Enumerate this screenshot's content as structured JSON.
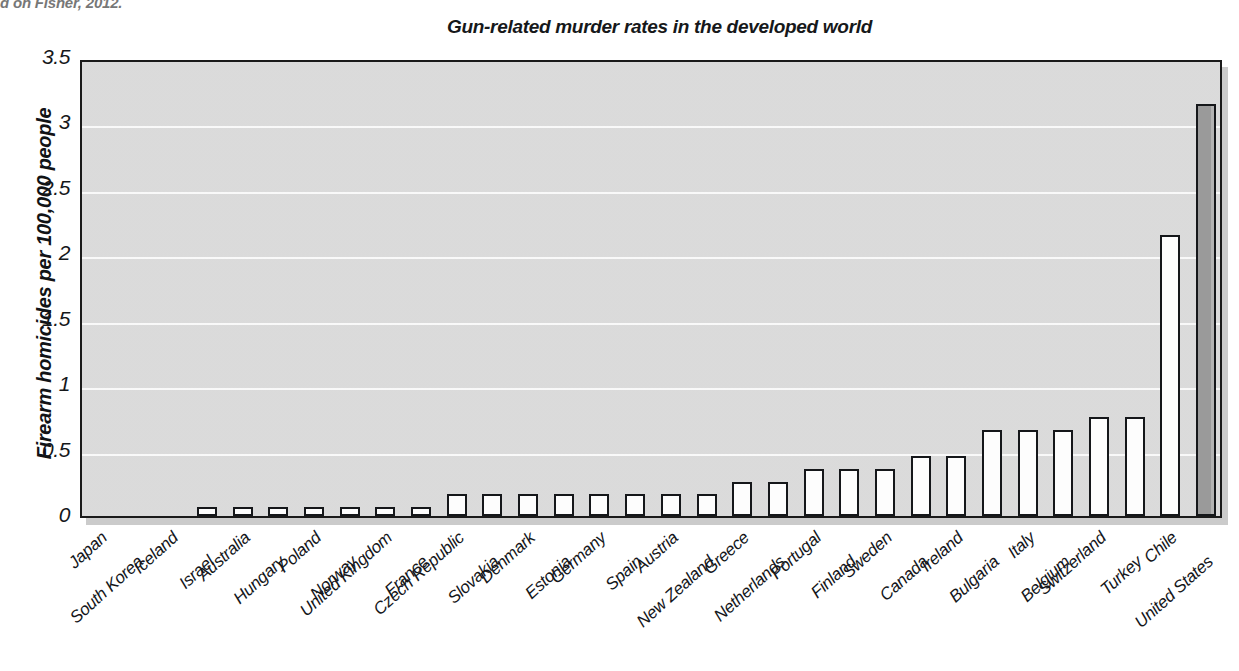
{
  "caption_fragment": "d on Fisher, 2012.",
  "chart_title": "Gun-related murder rates in the developed world",
  "axes": {
    "y_title": "Firearm homicides per 100,000 people",
    "y_ticks": [
      "0",
      "0.5",
      "1",
      "1.5",
      "2",
      "2.5",
      "3",
      "3.5"
    ]
  },
  "chart_data": {
    "type": "bar",
    "title": "Gun-related murder rates in the developed world",
    "xlabel": "",
    "ylabel": "Firearm homicides per 100,000 people",
    "ylim": [
      0,
      3.5
    ],
    "yticks": [
      0,
      0.5,
      1,
      1.5,
      2,
      2.5,
      3,
      3.5
    ],
    "grid": true,
    "legend": "none",
    "orientation": "vertical",
    "highlight_category": "United States",
    "categories": [
      "Japan",
      "South Korea",
      "Iceland",
      "Israel",
      "Australia",
      "Hungary",
      "Poland",
      "Norway",
      "United Kingdom",
      "France",
      "Czech Republic",
      "Slovakia",
      "Denmark",
      "Estonia",
      "Germany",
      "Spain",
      "Austria",
      "New Zealand",
      "Greece",
      "Netherlands",
      "Portugal",
      "Finland",
      "Sweden",
      "Canada",
      "Ireland",
      "Bulgaria",
      "Italy",
      "Belgium",
      "Switzerland",
      "Turkey",
      "Chile",
      "United States"
    ],
    "values": [
      0.0,
      0.0,
      0.0,
      0.07,
      0.07,
      0.07,
      0.07,
      0.07,
      0.07,
      0.07,
      0.17,
      0.17,
      0.17,
      0.17,
      0.17,
      0.17,
      0.17,
      0.17,
      0.26,
      0.26,
      0.36,
      0.36,
      0.36,
      0.46,
      0.46,
      0.66,
      0.66,
      0.66,
      0.76,
      0.76,
      2.15,
      3.15
    ]
  },
  "colors": {
    "plot_background": "#dcdcdc",
    "bar_fill": "#fdfdfd",
    "bar_fill_highlight": "#9a9a9a",
    "bar_outline": "#15171a",
    "gridline": "#fbfbfb",
    "text": "#15171a"
  }
}
